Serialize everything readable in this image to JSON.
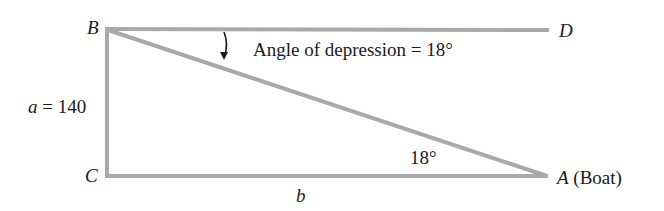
{
  "diagram": {
    "line_color": "#a9a9a9",
    "points": {
      "B": {
        "label": "B",
        "x": 107,
        "y": 28
      },
      "C": {
        "label": "C",
        "x": 107,
        "y": 176
      },
      "A": {
        "label": "A",
        "x": 547,
        "y": 176,
        "note": "(Boat)"
      },
      "D": {
        "label": "D",
        "x": 548,
        "y": 30
      }
    },
    "side_a": {
      "var": "a",
      "eq": " = 140"
    },
    "side_b": {
      "var": "b"
    },
    "angle_depression_label": "Angle of depression = 18°",
    "angle_A_label": "18°"
  }
}
